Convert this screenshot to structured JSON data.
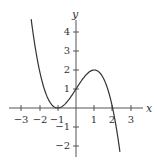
{
  "chart_data": {
    "type": "line",
    "title": "",
    "xlabel": "x",
    "ylabel": "y",
    "xlim": [
      -3.5,
      3.5
    ],
    "ylim": [
      -2.6,
      4.6
    ],
    "x_ticks": [
      -3,
      -2,
      -1,
      1,
      2,
      3
    ],
    "y_ticks": [
      -2,
      -1,
      1,
      2,
      3,
      4
    ],
    "grid": false,
    "legend": null,
    "series": [
      {
        "name": "f(x)",
        "function": "-0.5*(x+1)^2*(x-2)",
        "x": [
          -2.45,
          -2,
          -1.5,
          -1,
          -0.5,
          0,
          0.5,
          1,
          1.5,
          2,
          2.4
        ],
        "values": [
          4.4,
          2.0,
          0.44,
          0.0,
          0.31,
          1.0,
          1.69,
          2.0,
          1.56,
          0.0,
          -2.31
        ]
      }
    ],
    "key_points": {
      "double_root": [
        -1,
        0
      ],
      "y_intercept": [
        0,
        1
      ],
      "local_max": [
        1,
        2
      ],
      "root": [
        2,
        0
      ]
    }
  },
  "labels": {
    "x_axis": "x",
    "y_axis": "y",
    "x_ticks": [
      "−3",
      "−2",
      "−1",
      "1",
      "2",
      "3"
    ],
    "y_ticks": [
      "4",
      "3",
      "2",
      "1",
      "−1",
      "−2"
    ]
  }
}
